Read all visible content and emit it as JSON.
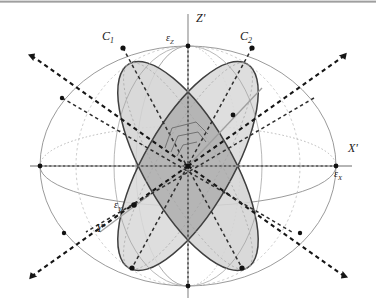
{
  "figure": {
    "labels": {
      "axis_z": "Z'",
      "axis_x": "X'",
      "axis_y": "Y'",
      "eps_z_main": "ε",
      "eps_z_sub": "Z",
      "eps_x_main": "ε",
      "eps_x_sub": "X",
      "eps_y_main": "ε",
      "eps_y_sub": "Y",
      "circle_1_main": "C",
      "circle_1_sub": "1",
      "circle_2_main": "C",
      "circle_2_sub": "2"
    },
    "colors": {
      "background": "#ffffff",
      "sphere_outline": "#8a8a8a",
      "disk_fill_light": "#d9d9d9",
      "disk_fill_mid": "#cdcdcd",
      "disk_overlap": "#b3b3b3",
      "disk_edge_dark": "#3a3a3a",
      "dashed_axis": "#1c1c1c",
      "solid_axis_gray": "#9a9a9a",
      "node_dot": "#111111",
      "label_text": "#1a1a1a",
      "frame_line": "#9a9a9a"
    },
    "geometry": {
      "center_x": 188,
      "center_y": 166,
      "sphere_radius_x": 148,
      "sphere_radius_y": 120,
      "equator_ry": 40,
      "disk_tilt_deg_c1": -38,
      "disk_tilt_deg_c2": 38
    },
    "node_count": 13
  }
}
